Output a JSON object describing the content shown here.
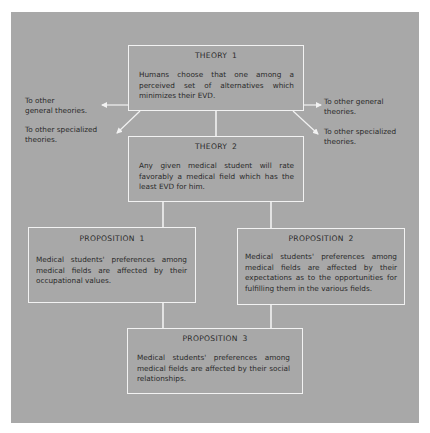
{
  "diagram": {
    "colors": {
      "background": "#a8a8a8",
      "border": "#f2f2f2",
      "text": "#2a2a2a"
    },
    "theory1": {
      "title": "THEORY 1",
      "body": "Humans choose that one among a perceived set of alternatives which minimizes their EVD."
    },
    "theory2": {
      "title": "THEORY 2",
      "body": "Any given medical student will rate favorably a medical field which has the least EVD for him."
    },
    "proposition1": {
      "title": "PROPOSITION 1",
      "body": "Medical students' preferences among medical fields are affected by their occupational values."
    },
    "proposition2": {
      "title": "PROPOSITION 2",
      "body": "Medical students' preferences among medical fields are affected by their expectations as to the opportunities for fulfilling them in the various fields."
    },
    "proposition3": {
      "title": "PROPOSITION 3",
      "body": "Medical students' preferences among medical fields are affected by their social relationships."
    },
    "side_labels": {
      "left_general_line1": "To other",
      "left_general_line2": "general theories.",
      "left_specialized_line1": "To other specialized",
      "left_specialized_line2": "theories.",
      "right_general_line1": "To other general",
      "right_general_line2": "theories.",
      "right_specialized_line1": "To other specialized",
      "right_specialized_line2": "theories."
    }
  }
}
